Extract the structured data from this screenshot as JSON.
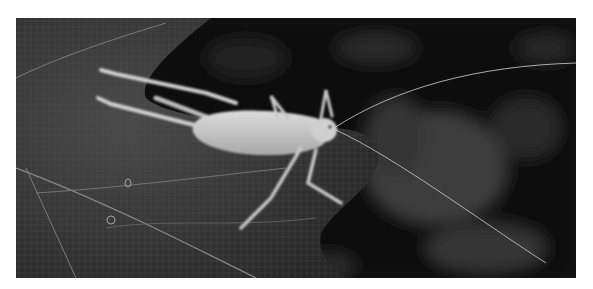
{
  "image": {
    "subject": "katydid on leaf",
    "style": "grayscale macro photograph",
    "border_color": "#ffffff",
    "background_color": "#0d0d0d",
    "leaf_color": "#3a3a3a",
    "insect_color": "#c9c9c9"
  }
}
